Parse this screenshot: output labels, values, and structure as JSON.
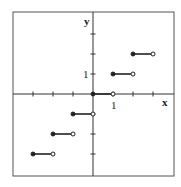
{
  "chart_data": {
    "type": "line",
    "title": "",
    "subtitle": "Step (greatest integer / floor) function y = [x]",
    "xlabel": "x",
    "ylabel": "y",
    "tick_labels": {
      "x": [
        "1"
      ],
      "y": [
        "1"
      ]
    },
    "xlim": [
      -4,
      3
    ],
    "ylim": [
      -4,
      3
    ],
    "grid": false,
    "legend": null,
    "segments": [
      {
        "x_start": -3,
        "x_end": -2,
        "y": -3,
        "start": "closed",
        "end": "open"
      },
      {
        "x_start": -2,
        "x_end": -1,
        "y": -2,
        "start": "closed",
        "end": "open"
      },
      {
        "x_start": -1,
        "x_end": 0,
        "y": -1,
        "start": "closed",
        "end": "open"
      },
      {
        "x_start": 0,
        "x_end": 1,
        "y": 0,
        "start": "closed",
        "end": "open"
      },
      {
        "x_start": 1,
        "x_end": 2,
        "y": 1,
        "start": "closed",
        "end": "open"
      },
      {
        "x_start": 2,
        "x_end": 3,
        "y": 2,
        "start": "closed",
        "end": "open"
      }
    ]
  },
  "axes": {
    "x_label": "x",
    "y_label": "y",
    "x_tick_label": "1",
    "y_tick_label": "1"
  }
}
